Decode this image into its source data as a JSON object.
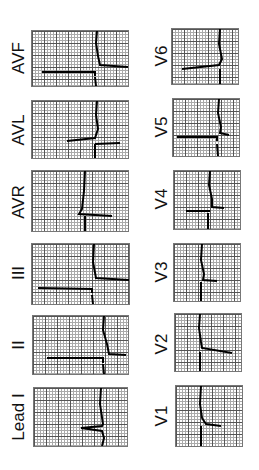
{
  "left_column": [
    {
      "lead": "AVF"
    },
    {
      "lead": "AVL"
    },
    {
      "lead": "AVR"
    },
    {
      "lead": "III"
    },
    {
      "lead": "II"
    },
    {
      "lead": "Lead I"
    }
  ],
  "right_column": [
    {
      "lead": "V6"
    },
    {
      "lead": "V5"
    },
    {
      "lead": "V4"
    },
    {
      "lead": "V3"
    },
    {
      "lead": "V2"
    },
    {
      "lead": "V1"
    }
  ]
}
